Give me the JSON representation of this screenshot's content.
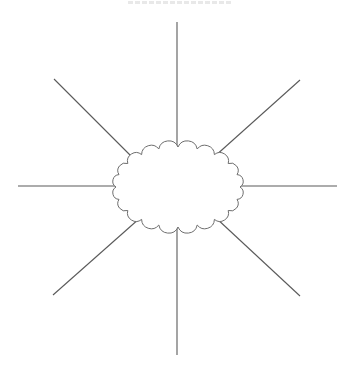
{
  "diagram": {
    "type": "radial-web-organizer",
    "title": "",
    "title_visible_state": "clipped-at-top-edge-illegible",
    "center": {
      "shape": "cloud",
      "label": "",
      "cx": 178,
      "cy": 187,
      "rx": 62,
      "ry": 40,
      "bumps": 20
    },
    "spokes": [
      {
        "name": "spoke-top",
        "x1": 177,
        "y1": 22,
        "x2": 177,
        "y2": 153
      },
      {
        "name": "spoke-top-right",
        "x1": 300,
        "y1": 80,
        "x2": 214,
        "y2": 157
      },
      {
        "name": "spoke-right",
        "x1": 337,
        "y1": 186,
        "x2": 240,
        "y2": 186
      },
      {
        "name": "spoke-bottom-right",
        "x1": 300,
        "y1": 296,
        "x2": 215,
        "y2": 217
      },
      {
        "name": "spoke-bottom",
        "x1": 177,
        "y1": 355,
        "x2": 177,
        "y2": 222
      },
      {
        "name": "spoke-bottom-left",
        "x1": 53,
        "y1": 295,
        "x2": 140,
        "y2": 218
      },
      {
        "name": "spoke-left",
        "x1": 18,
        "y1": 186,
        "x2": 117,
        "y2": 186
      },
      {
        "name": "spoke-top-left",
        "x1": 54,
        "y1": 79,
        "x2": 132,
        "y2": 157
      }
    ],
    "colors": {
      "line": "#5a5a5a",
      "cloud_stroke": "#6e6e6e",
      "background": "#ffffff"
    }
  }
}
